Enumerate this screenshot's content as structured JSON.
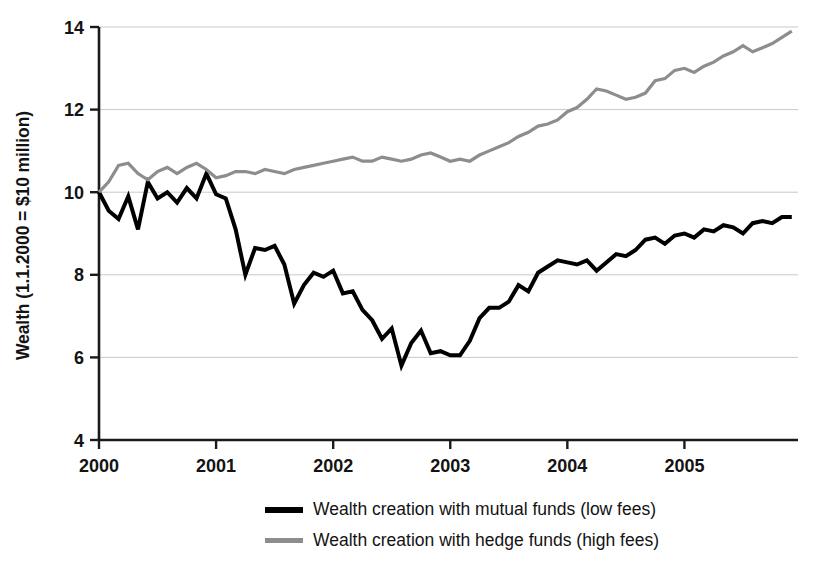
{
  "chart_data": {
    "type": "line",
    "title": "",
    "subtitle": "",
    "xlabel": "",
    "ylabel": "Wealth (1.1.2000 = $10 million)",
    "xlim": [
      2000.0,
      2005.97
    ],
    "ylim": [
      4,
      14
    ],
    "yticks": [
      4,
      6,
      8,
      10,
      12,
      14
    ],
    "ytick_labels": [
      "4",
      "6",
      "8",
      "10",
      "12",
      "14"
    ],
    "xticks": [
      2000,
      2001,
      2002,
      2003,
      2004,
      2005
    ],
    "xtick_labels": [
      "2000",
      "2001",
      "2002",
      "2003",
      "2004",
      "2005"
    ],
    "grid": true,
    "grid_axis": "y",
    "legend_position": "bottom",
    "x": [
      2000.0,
      2000.083,
      2000.167,
      2000.25,
      2000.333,
      2000.417,
      2000.5,
      2000.583,
      2000.667,
      2000.75,
      2000.833,
      2000.917,
      2001.0,
      2001.083,
      2001.167,
      2001.25,
      2001.333,
      2001.417,
      2001.5,
      2001.583,
      2001.667,
      2001.75,
      2001.833,
      2001.917,
      2002.0,
      2002.083,
      2002.167,
      2002.25,
      2002.333,
      2002.417,
      2002.5,
      2002.583,
      2002.667,
      2002.75,
      2002.833,
      2002.917,
      2003.0,
      2003.083,
      2003.167,
      2003.25,
      2003.333,
      2003.417,
      2003.5,
      2003.583,
      2003.667,
      2003.75,
      2003.833,
      2003.917,
      2004.0,
      2004.083,
      2004.167,
      2004.25,
      2004.333,
      2004.417,
      2004.5,
      2004.583,
      2004.667,
      2004.75,
      2004.833,
      2004.917,
      2005.0,
      2005.083,
      2005.167,
      2005.25,
      2005.333,
      2005.417,
      2005.5,
      2005.583,
      2005.667,
      2005.75,
      2005.833,
      2005.917
    ],
    "series": [
      {
        "name": "Wealth creation with mutual funds (low fees)",
        "color": "#000000",
        "linewidth": 4.0,
        "values": [
          10.0,
          9.55,
          9.35,
          9.9,
          9.1,
          10.25,
          9.85,
          10.0,
          9.75,
          10.1,
          9.85,
          10.45,
          9.95,
          9.85,
          9.1,
          8.0,
          8.65,
          8.6,
          8.7,
          8.25,
          7.3,
          7.75,
          8.05,
          7.95,
          8.1,
          7.55,
          7.6,
          7.15,
          6.9,
          6.45,
          6.7,
          5.8,
          6.35,
          6.65,
          6.1,
          6.15,
          6.05,
          6.05,
          6.4,
          6.95,
          7.2,
          7.2,
          7.35,
          7.75,
          7.6,
          8.05,
          8.2,
          8.35,
          8.3,
          8.25,
          8.35,
          8.1,
          8.3,
          8.5,
          8.45,
          8.6,
          8.85,
          8.9,
          8.75,
          8.95,
          9.0,
          8.9,
          9.1,
          9.05,
          9.2,
          9.15,
          9.0,
          9.25,
          9.3,
          9.25,
          9.4,
          9.4
        ]
      },
      {
        "name": "Wealth creation with hedge funds (high fees)",
        "color": "#8d8d8d",
        "linewidth": 3.2,
        "values": [
          10.0,
          10.25,
          10.65,
          10.7,
          10.45,
          10.3,
          10.5,
          10.6,
          10.45,
          10.6,
          10.7,
          10.55,
          10.35,
          10.4,
          10.5,
          10.5,
          10.45,
          10.55,
          10.5,
          10.45,
          10.55,
          10.6,
          10.65,
          10.7,
          10.75,
          10.8,
          10.85,
          10.75,
          10.75,
          10.85,
          10.8,
          10.75,
          10.8,
          10.9,
          10.95,
          10.85,
          10.75,
          10.8,
          10.75,
          10.9,
          11.0,
          11.1,
          11.2,
          11.35,
          11.45,
          11.6,
          11.65,
          11.75,
          11.95,
          12.05,
          12.25,
          12.5,
          12.45,
          12.35,
          12.25,
          12.3,
          12.4,
          12.7,
          12.75,
          12.95,
          13.0,
          12.9,
          13.05,
          13.15,
          13.3,
          13.4,
          13.55,
          13.4,
          13.5,
          13.6,
          13.75,
          13.9
        ]
      }
    ]
  },
  "legend": {
    "items": [
      {
        "label": "Wealth creation with mutual funds (low fees)",
        "swatch": "black-line-swatch"
      },
      {
        "label": "Wealth creation with hedge funds (high fees)",
        "swatch": "gray-line-swatch"
      }
    ]
  }
}
